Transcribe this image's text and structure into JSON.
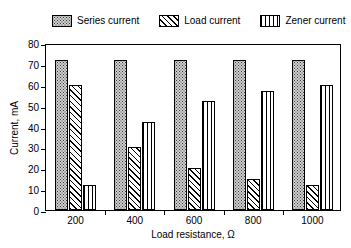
{
  "chart_data": {
    "type": "bar",
    "title": "",
    "xlabel": "Load resistance, Ω",
    "ylabel": "Current, mA",
    "categories": [
      "200",
      "400",
      "600",
      "800",
      "1000"
    ],
    "ylim": [
      0,
      80
    ],
    "yticks": [
      0,
      10,
      20,
      30,
      40,
      50,
      60,
      70,
      80
    ],
    "grid": false,
    "legend_position": "top",
    "series": [
      {
        "name": "Series current",
        "pattern": "dots",
        "values": [
          72,
          72,
          72,
          72,
          72
        ]
      },
      {
        "name": "Load current",
        "pattern": "diagonal-hatch",
        "values": [
          60,
          30,
          20,
          15,
          12
        ]
      },
      {
        "name": "Zener current",
        "pattern": "vertical-lines",
        "values": [
          12,
          42,
          52,
          57,
          60
        ]
      }
    ]
  }
}
